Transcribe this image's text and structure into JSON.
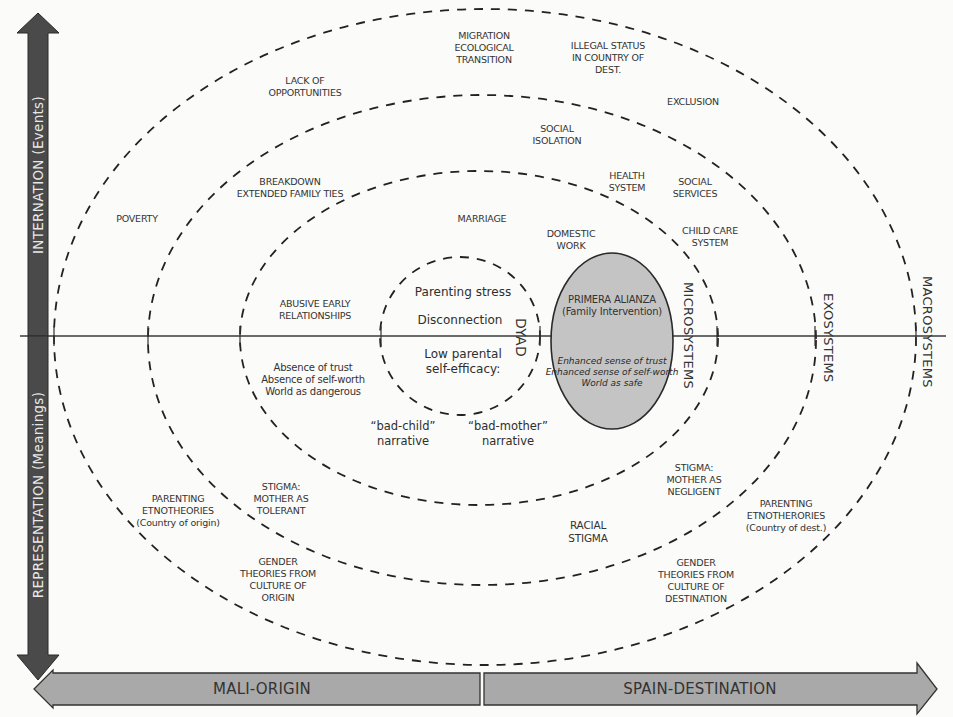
{
  "diagram": {
    "axes": {
      "vertical_top": "INTERNATION (Events)",
      "vertical_bottom": "REPRESENTATION (Meanings)",
      "horizontal_left": "MALI-ORIGIN",
      "horizontal_right": "SPAIN-DESTINATION"
    },
    "systems": {
      "dyad": "DYAD",
      "micro": "MICROSYSTEMS",
      "exo": "EXOSYSTEMS",
      "macro": "MACROSYSTEMS"
    },
    "dyad_items": {
      "stress": "Parenting stress",
      "disconnection": "Disconnection",
      "self_efficacy": "Low parental\nself-efficacy:",
      "bad_child": "“bad-child”\nnarrative",
      "bad_mother": "“bad-mother”\nnarrative"
    },
    "intervention": {
      "title": "PRIMERA ALIANZA\n(Family Intervention)",
      "outcomes": "Enhanced sense of trust\nEnhanced sense of self-worth\nWorld as safe",
      "fill_color": "#c4c4c4"
    },
    "events_origin": {
      "poverty": "POVERTY",
      "lack_opportunities": "LACK OF\nOPPORTUNITIES",
      "breakdown": "BREAKDOWN\nEXTENDED FAMILY TIES",
      "abusive": "ABUSIVE EARLY\nRELATIONSHIPS"
    },
    "events_destination": {
      "migration": "MIGRATION\nECOLOGICAL\nTRANSITION",
      "illegal_status": "ILLEGAL STATUS\nIN COUNTRY OF\nDEST.",
      "exclusion": "EXCLUSION",
      "social_isolation": "SOCIAL\nISOLATION",
      "health_system": "HEALTH\nSYSTEM",
      "social_services": "SOCIAL\nSERVICES",
      "marriage": "MARRIAGE",
      "domestic_work": "DOMESTIC\nWORK",
      "child_care": "CHILD CARE\nSYSTEM"
    },
    "meanings_origin": {
      "absence": "Absence of trust\nAbsence of self-worth\nWorld as dangerous",
      "stigma_tolerant": "STIGMA:\nMOTHER AS\nTOLERANT",
      "etnotheories_origin": "PARENTING\nETNOTHEORIES\n(Country of origin)",
      "gender_origin": "GENDER\nTHEORIES FROM\nCULTURE OF\nORIGIN"
    },
    "meanings_destination": {
      "stigma_negligent": "STIGMA:\nMOTHER AS\nNEGLIGENT",
      "racial_stigma": "RACIAL\nSTIGMA",
      "etnotheories_dest": "PARENTING\nETNOTHERORIES\n(Country of dest.)",
      "gender_dest": "GENDER\nTHEORIES FROM\nCULTURE OF\nDESTINATION"
    },
    "colors": {
      "vertical_arrow": "#4a4a4a",
      "horizontal_arrow": "#a9a9a9",
      "line": "#333333",
      "background": "#fbfbf9"
    }
  }
}
